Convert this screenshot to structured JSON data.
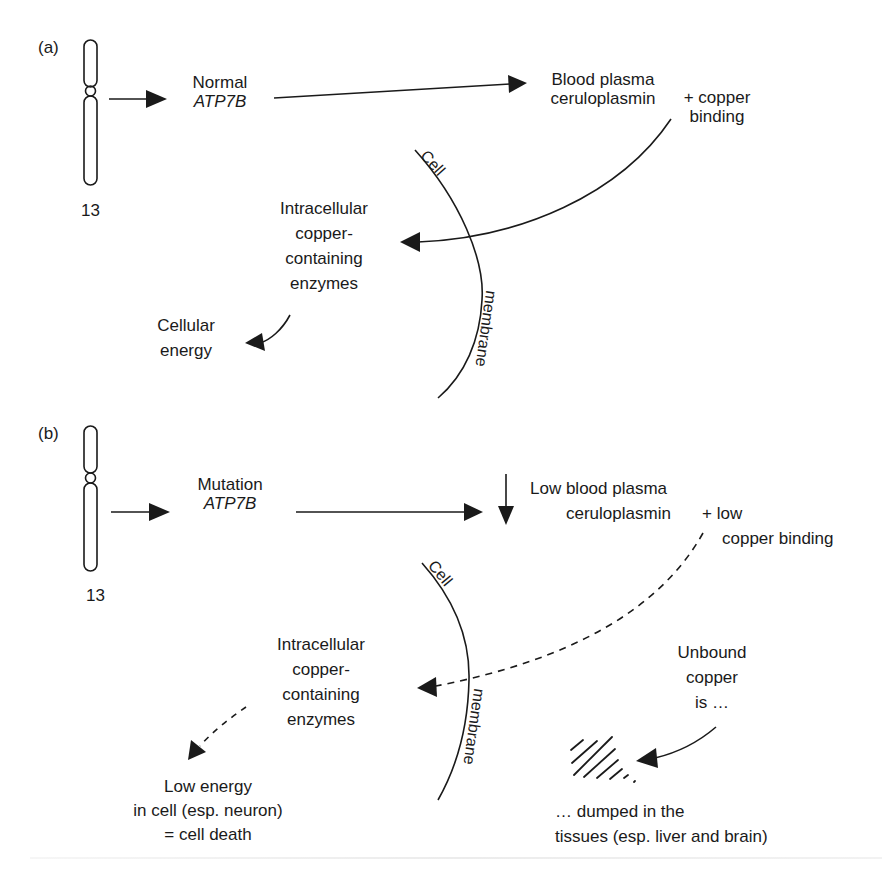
{
  "figure": {
    "panels": [
      {
        "id": "a",
        "tag": "(a)",
        "chromosome_label": "13",
        "gene": {
          "line1": "Normal",
          "line2": "ATP7B"
        },
        "plasma": {
          "line1": "Blood plasma",
          "line2": "ceruloplasmin",
          "plus": "+ copper",
          "line3": "binding"
        },
        "cell_membrane": {
          "top": "Cell",
          "bottom": "membrane"
        },
        "enzymes": {
          "line1": "Intracellular",
          "line2": "copper-",
          "line3": "containing",
          "line4": "enzymes"
        },
        "outcome": {
          "line1": "Cellular",
          "line2": "energy"
        },
        "arrow_style": "solid"
      },
      {
        "id": "b",
        "tag": "(b)",
        "chromosome_label": "13",
        "gene": {
          "line1": "Mutation",
          "line2": "ATP7B"
        },
        "plasma": {
          "line1": "Low blood plasma",
          "line2": "ceruloplasmin",
          "plus": "+ low",
          "line3": "copper binding"
        },
        "cell_membrane": {
          "top": "Cell",
          "bottom": "membrane"
        },
        "enzymes": {
          "line1": "Intracellular",
          "line2": "copper-",
          "line3": "containing",
          "line4": "enzymes"
        },
        "outcome": {
          "line1": "Low energy",
          "line2": "in cell (esp. neuron)",
          "line3": "= cell death"
        },
        "unbound": {
          "line1": "Unbound",
          "line2": "copper",
          "line3": "is …"
        },
        "dumped": {
          "line1": "… dumped in the",
          "line2": "tissues (esp. liver and brain)"
        },
        "decrease_indicator": "down-arrow",
        "arrow_style": "dashed"
      }
    ],
    "colors": {
      "ink": "#1a1a1a",
      "background": "#ffffff"
    }
  }
}
